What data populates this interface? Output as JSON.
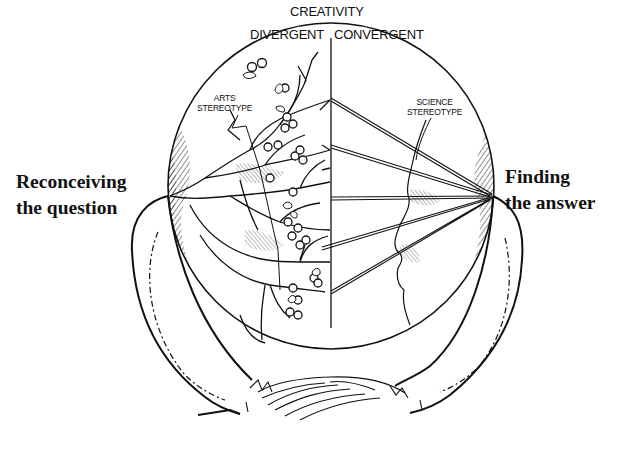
{
  "diagram": {
    "title": "CREATIVITY",
    "halves": {
      "left": "DIVERGENT",
      "right": "CONVERGENT"
    },
    "stereotypes": {
      "left": [
        "ARTS",
        "STEREOTYPE"
      ],
      "right": [
        "SCIENCE",
        "STEREOTYPE"
      ]
    },
    "captions": {
      "left": [
        "Reconceiving",
        "the question"
      ],
      "right": [
        "Finding",
        "the answer"
      ]
    },
    "illustration": {
      "shape": "head-seen-from-behind-with-circular-brain-window",
      "left_half": "branching tree with berries and leaves (divergent thinking)",
      "right_half": "straight lines converging to a single point; facial profile (convergent thinking)",
      "convergent_line_count": 5
    },
    "colors": {
      "ink": "#111111",
      "background": "#ffffff"
    }
  }
}
